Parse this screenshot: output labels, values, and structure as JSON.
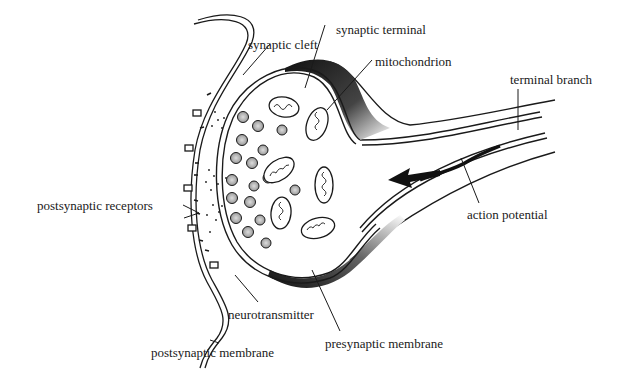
{
  "diagram": {
    "colors": {
      "ink": "#1a1a1a",
      "background": "#ffffff"
    },
    "labels": {
      "synaptic_cleft": "synaptic cleft",
      "synaptic_terminal": "synaptic terminal",
      "mitochondrion": "mitochondrion",
      "terminal_branch": "terminal branch",
      "postsynaptic_receptors": "postsynaptic receptors",
      "action_potential": "action potential",
      "neurotransmitter": "neurotransmitter",
      "presynaptic_membrane": "presynaptic membrane",
      "postsynaptic_membrane": "postsynaptic membrane"
    },
    "arrow": {
      "semantic": "arrow-left-icon",
      "meaning": "direction of action potential"
    }
  }
}
